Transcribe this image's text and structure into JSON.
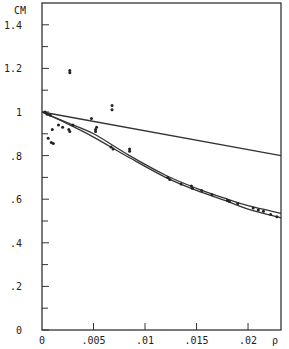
{
  "chart_data": {
    "type": "scatter",
    "title": "",
    "xlabel": "ρ",
    "ylabel": "CM",
    "xlim": [
      0,
      0.0232
    ],
    "ylim": [
      0,
      1.5
    ],
    "x_ticks": [
      0,
      0.005,
      0.01,
      0.015,
      0.02
    ],
    "x_tick_labels": [
      "0",
      ".005",
      ".01",
      ".015",
      ".02"
    ],
    "y_ticks": [
      0,
      0.2,
      0.4,
      0.6,
      0.8,
      1.0,
      1.2,
      1.4
    ],
    "y_tick_labels": [
      "0",
      ".2",
      ".4",
      ".6",
      ".8",
      "1",
      "1.2",
      "1.4"
    ],
    "y_minor_ticks": [
      0.1,
      0.3,
      0.5,
      0.7,
      0.9,
      1.1,
      1.3
    ],
    "grid": false,
    "legend": null,
    "series": [
      {
        "name": "straight line",
        "kind": "line",
        "x": [
          0,
          0.0232
        ],
        "y": [
          1.0,
          0.8
        ]
      },
      {
        "name": "upper curve",
        "kind": "line",
        "x": [
          0,
          0.0025,
          0.005,
          0.0085,
          0.012,
          0.015,
          0.018,
          0.02,
          0.0232
        ],
        "y": [
          1.0,
          0.95,
          0.9,
          0.8,
          0.71,
          0.65,
          0.6,
          0.57,
          0.535
        ]
      },
      {
        "name": "lower curve",
        "kind": "line",
        "x": [
          0,
          0.0025,
          0.005,
          0.0085,
          0.012,
          0.015,
          0.018,
          0.02,
          0.0232
        ],
        "y": [
          1.0,
          0.945,
          0.885,
          0.79,
          0.7,
          0.64,
          0.59,
          0.555,
          0.515
        ]
      },
      {
        "name": "measured points",
        "kind": "scatter",
        "x": [
          0.0003,
          0.0005,
          0.0008,
          0.0006,
          0.0009,
          0.0011,
          0.001,
          0.0016,
          0.002,
          0.0026,
          0.0027,
          0.0027,
          0.0027,
          0.003,
          0.0048,
          0.0052,
          0.0052,
          0.0053,
          0.0068,
          0.0068,
          0.0067,
          0.0069,
          0.0085,
          0.0085,
          0.0122,
          0.0124,
          0.0135,
          0.0145,
          0.0146,
          0.0155,
          0.0165,
          0.018,
          0.0182,
          0.019,
          0.0205,
          0.021,
          0.0215,
          0.0222,
          0.0228
        ],
        "y": [
          1.0,
          0.99,
          0.985,
          0.88,
          0.86,
          0.855,
          0.92,
          0.94,
          0.93,
          0.92,
          0.91,
          1.19,
          1.18,
          0.94,
          0.97,
          0.92,
          0.91,
          0.93,
          1.03,
          1.01,
          0.84,
          0.83,
          0.83,
          0.82,
          0.7,
          0.69,
          0.67,
          0.66,
          0.65,
          0.64,
          0.62,
          0.595,
          0.59,
          0.58,
          0.56,
          0.55,
          0.545,
          0.53,
          0.52
        ]
      }
    ]
  }
}
